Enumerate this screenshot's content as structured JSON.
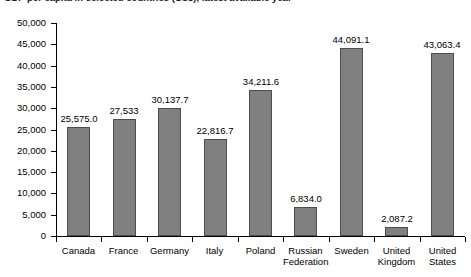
{
  "title_strip": {
    "text": "GDP per capita in selected countries (US$), latest available year"
  },
  "chart_data": {
    "type": "bar",
    "title": "",
    "xlabel": "",
    "ylabel": "",
    "ylim": [
      0,
      50000
    ],
    "ytick_values": [
      0,
      5000,
      10000,
      15000,
      20000,
      25000,
      30000,
      35000,
      40000,
      45000,
      50000
    ],
    "ytick_labels": [
      "0",
      "5,000",
      "10,000",
      "15,000",
      "20,000",
      "25,000",
      "30,000",
      "35,000",
      "40,000",
      "45,000",
      "50,000"
    ],
    "grid": false,
    "legend": false,
    "bar_color": "#808080",
    "bar_edge_color": "#4d4d4d",
    "categories": [
      "Canada",
      "France",
      "Germany",
      "Italy",
      "Poland",
      "Russian\nFederation",
      "Sweden",
      "United\nKingdom",
      "United\nStates"
    ],
    "values": [
      25575.0,
      27533,
      30137.7,
      22816.7,
      34211.6,
      6834.0,
      44091.1,
      2087.2,
      43063.4
    ],
    "value_labels": [
      "25,575.0",
      "27,533",
      "30,137.7",
      "22,816.7",
      "34,211.6",
      "6,834.0",
      "44,091.1",
      "2,087.2",
      "43,063.4"
    ]
  }
}
